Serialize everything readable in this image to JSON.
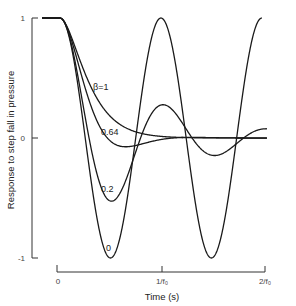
{
  "chart_data": {
    "type": "line",
    "title": "",
    "xlabel": "Time (s)",
    "ylabel": "Response to step fall in pressure",
    "x_ticks": [
      "0",
      "1/f₀",
      "2/f₀"
    ],
    "y_ticks": [
      "1",
      "0",
      "-1"
    ],
    "ylim": [
      -1,
      1
    ],
    "xlim": [
      0,
      2.0
    ],
    "grid": false,
    "legend": "inline labels on curves",
    "annotation_prefix": "β=",
    "series": [
      {
        "name": "β=1",
        "label": "β=1",
        "beta": 1.0
      },
      {
        "name": "0.64",
        "label": "0.64",
        "beta": 0.64
      },
      {
        "name": "0.2",
        "label": "0.2",
        "beta": 0.2
      },
      {
        "name": "0",
        "label": "0",
        "beta": 0.0
      }
    ]
  },
  "labels": {
    "beta1": "β=1",
    "beta064": "0.64",
    "beta02": "0.2",
    "beta0": "0",
    "ytick_top": "1",
    "ytick_mid": "0",
    "ytick_bot": "-1",
    "xtick0": "0",
    "xtick1": "1/f₀",
    "xtick2": "2/f₀",
    "xlabel": "Time (s)",
    "ylabel": "Response to step fall in pressure"
  }
}
